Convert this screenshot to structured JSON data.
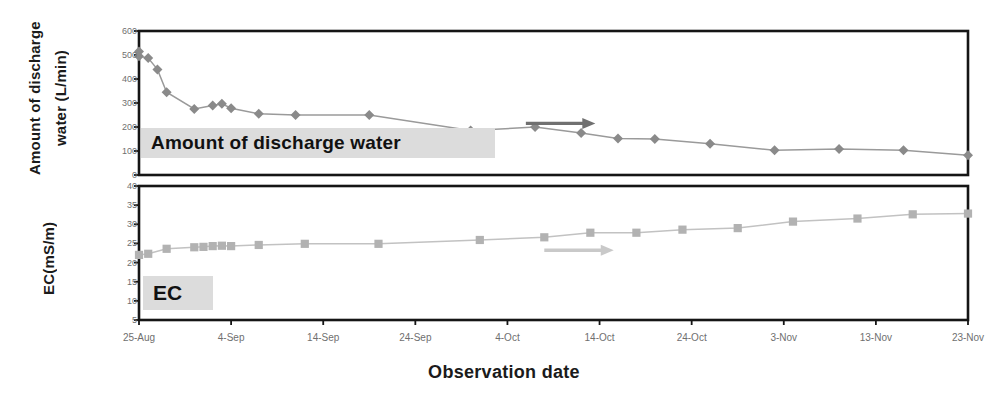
{
  "figure": {
    "xlabel": "Observation date",
    "panels": [
      {
        "id": "discharge",
        "ylabel": "Amount of discharge water (L/min)",
        "ylabel_line1": "Amount of",
        "ylabel_line2": "discharge water",
        "ylabel_line3": "(L/min)",
        "caption": "Amount of discharge water"
      },
      {
        "id": "ec",
        "ylabel": "EC(mS/m)",
        "caption": "EC"
      }
    ]
  },
  "colors": {
    "discharge_marker": "#8a8a8a",
    "discharge_line": "#9a9a9a",
    "discharge_arrow": "#707070",
    "ec_marker": "#b2b2b2",
    "ec_line": "#c2c2c2",
    "ec_arrow": "#c9c9c9",
    "axis": "#151515",
    "tick_text": "#6f6f6f",
    "caption_bg": "#dcdcdc",
    "title_text": "#1b1b1b"
  },
  "chart_data": [
    {
      "type": "line",
      "id": "discharge",
      "title": "Amount of discharge water",
      "xlabel": "Observation date",
      "ylabel": "Amount of discharge water (L/min)",
      "ylim": [
        0,
        600
      ],
      "yticks": [
        0,
        100,
        200,
        300,
        400,
        500,
        600
      ],
      "xlim": [
        "25-Aug",
        "23-Nov"
      ],
      "xticks": [
        "25-Aug",
        "4-Sep",
        "14-Sep",
        "24-Sep",
        "4-Oct",
        "14-Oct",
        "24-Oct",
        "3-Nov",
        "13-Nov",
        "23-Nov"
      ],
      "grid": false,
      "legend": "none",
      "marker": "diamond",
      "x": [
        "25-Aug",
        "25-Aug",
        "26-Aug",
        "27-Aug",
        "28-Aug",
        "31-Aug",
        "2-Sep",
        "3-Sep",
        "4-Sep",
        "7-Sep",
        "11-Sep",
        "19-Sep",
        "30-Sep",
        "7-Oct",
        "12-Oct",
        "16-Oct",
        "20-Oct",
        "26-Oct",
        "2-Nov",
        "9-Nov",
        "16-Nov",
        "23-Nov"
      ],
      "values": [
        515,
        495,
        487,
        440,
        345,
        275,
        290,
        297,
        278,
        255,
        250,
        250,
        185,
        200,
        175,
        152,
        150,
        130,
        103,
        108,
        103,
        82
      ],
      "annotations": [
        {
          "type": "arrow",
          "direction": "right",
          "from": "6-Oct",
          "to": "13-Oct",
          "y": 215,
          "color": "#707070"
        }
      ]
    },
    {
      "type": "line",
      "id": "ec",
      "title": "EC",
      "xlabel": "Observation date",
      "ylabel": "EC(mS/m)",
      "ylim": [
        5,
        40
      ],
      "yticks": [
        5,
        10,
        15,
        20,
        25,
        30,
        35,
        40
      ],
      "xlim": [
        "25-Aug",
        "23-Nov"
      ],
      "xticks": [
        "25-Aug",
        "4-Sep",
        "14-Sep",
        "24-Sep",
        "4-Oct",
        "14-Oct",
        "24-Oct",
        "3-Nov",
        "13-Nov",
        "23-Nov"
      ],
      "grid": false,
      "legend": "none",
      "marker": "square",
      "x": [
        "25-Aug",
        "26-Aug",
        "28-Aug",
        "31-Aug",
        "1-Sep",
        "2-Sep",
        "3-Sep",
        "4-Sep",
        "7-Sep",
        "12-Sep",
        "20-Sep",
        "1-Oct",
        "8-Oct",
        "13-Oct",
        "18-Oct",
        "23-Oct",
        "29-Oct",
        "4-Nov",
        "11-Nov",
        "17-Nov",
        "23-Nov"
      ],
      "values": [
        22.0,
        22.3,
        23.6,
        24.0,
        24.1,
        24.3,
        24.4,
        24.3,
        24.6,
        24.9,
        24.9,
        25.9,
        26.6,
        27.8,
        27.8,
        28.6,
        29.0,
        30.7,
        31.5,
        32.6,
        32.8
      ],
      "annotations": [
        {
          "type": "arrow",
          "direction": "right",
          "from": "8-Oct",
          "to": "15-Oct",
          "y": 23.2,
          "color": "#c9c9c9"
        }
      ]
    }
  ]
}
